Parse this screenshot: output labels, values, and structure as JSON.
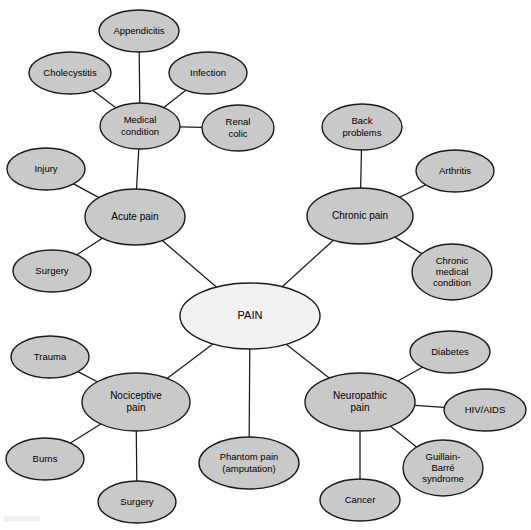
{
  "diagram": {
    "title": "PAIN",
    "type": "concept-map",
    "canvas": {
      "width": 531,
      "height": 530
    },
    "colors": {
      "root_fill": "#f1f1f1",
      "node_fill": "#c9c9c9",
      "stroke": "#1a1a1a",
      "text": "#000000",
      "background": "#ffffff"
    },
    "nodes": [
      {
        "id": "pain",
        "label": "PAIN",
        "lines": [
          "PAIN"
        ],
        "cx": 250,
        "cy": 316,
        "rx": 70,
        "ry": 33,
        "font": 11,
        "root": true
      },
      {
        "id": "acute-pain",
        "label": "Acute pain",
        "lines": [
          "Acute pain"
        ],
        "cx": 135,
        "cy": 217,
        "rx": 50,
        "ry": 28,
        "font": 10,
        "root": false
      },
      {
        "id": "chronic-pain",
        "label": "Chronic pain",
        "lines": [
          "Chronic pain"
        ],
        "cx": 360,
        "cy": 216,
        "rx": 53,
        "ry": 28,
        "font": 10,
        "root": false
      },
      {
        "id": "nociceptive-pain",
        "label": "Nociceptive pain",
        "lines": [
          "Nociceptive",
          "pain"
        ],
        "cx": 136,
        "cy": 402,
        "rx": 54,
        "ry": 29,
        "font": 10,
        "root": false
      },
      {
        "id": "neuropathic-pain",
        "label": "Neuropathic pain",
        "lines": [
          "Neuropathic",
          "pain"
        ],
        "cx": 360,
        "cy": 402,
        "rx": 55,
        "ry": 29,
        "font": 10,
        "root": false
      },
      {
        "id": "phantom-pain",
        "label": "Phantom pain (amputation)",
        "lines": [
          "Phantom pain",
          "(amputation)"
        ],
        "cx": 249,
        "cy": 463,
        "rx": 50,
        "ry": 26,
        "font": 9.5,
        "root": false
      },
      {
        "id": "medical-condition",
        "label": "Medical condition",
        "lines": [
          "Medical",
          "condition"
        ],
        "cx": 140,
        "cy": 126,
        "rx": 40,
        "ry": 23,
        "font": 9.5,
        "root": false
      },
      {
        "id": "appendicitis",
        "label": "Appendicitis",
        "lines": [
          "Appendicitis"
        ],
        "cx": 139,
        "cy": 31,
        "rx": 40,
        "ry": 21,
        "font": 9.5,
        "root": false
      },
      {
        "id": "cholecystitis",
        "label": "Cholecystitis",
        "lines": [
          "Cholecystitis"
        ],
        "cx": 70,
        "cy": 73,
        "rx": 41,
        "ry": 21,
        "font": 9.5,
        "root": false
      },
      {
        "id": "infection",
        "label": "Infection",
        "lines": [
          "Infection"
        ],
        "cx": 208,
        "cy": 73,
        "rx": 39,
        "ry": 21,
        "font": 9.5,
        "root": false
      },
      {
        "id": "renal-colic",
        "label": "Renal colic",
        "lines": [
          "Renal",
          "colic"
        ],
        "cx": 238,
        "cy": 128,
        "rx": 36,
        "ry": 23,
        "font": 9.5,
        "root": false
      },
      {
        "id": "injury",
        "label": "Injury",
        "lines": [
          "Injury"
        ],
        "cx": 46,
        "cy": 169,
        "rx": 39,
        "ry": 21,
        "font": 9.5,
        "root": false
      },
      {
        "id": "surgery-acute",
        "label": "Surgery",
        "lines": [
          "Surgery"
        ],
        "cx": 52,
        "cy": 271,
        "rx": 39,
        "ry": 21,
        "font": 9.5,
        "root": false
      },
      {
        "id": "back-problems",
        "label": "Back problems",
        "lines": [
          "Back",
          "problems"
        ],
        "cx": 362,
        "cy": 127,
        "rx": 40,
        "ry": 23,
        "font": 9.5,
        "root": false
      },
      {
        "id": "arthritis",
        "label": "Arthritis",
        "lines": [
          "Arthritis"
        ],
        "cx": 455,
        "cy": 171,
        "rx": 39,
        "ry": 21,
        "font": 9.5,
        "root": false
      },
      {
        "id": "chronic-medical-condition",
        "label": "Chronic medical condition",
        "lines": [
          "Chronic",
          "medical",
          "condition"
        ],
        "cx": 452,
        "cy": 272,
        "rx": 40,
        "ry": 28,
        "font": 9.5,
        "root": false
      },
      {
        "id": "trauma",
        "label": "Trauma",
        "lines": [
          "Trauma"
        ],
        "cx": 50,
        "cy": 357,
        "rx": 39,
        "ry": 21,
        "font": 9.5,
        "root": false
      },
      {
        "id": "burns",
        "label": "Burns",
        "lines": [
          "Burns"
        ],
        "cx": 45,
        "cy": 459,
        "rx": 39,
        "ry": 21,
        "font": 9.5,
        "root": false
      },
      {
        "id": "surgery-nociceptive",
        "label": "Surgery",
        "lines": [
          "Surgery"
        ],
        "cx": 137,
        "cy": 502,
        "rx": 39,
        "ry": 21,
        "font": 9.5,
        "root": false
      },
      {
        "id": "diabetes",
        "label": "Diabetes",
        "lines": [
          "Diabetes"
        ],
        "cx": 450,
        "cy": 352,
        "rx": 40,
        "ry": 21,
        "font": 9.5,
        "root": false
      },
      {
        "id": "hiv-aids",
        "label": "HIV/AIDS",
        "lines": [
          "HIV/AIDS"
        ],
        "cx": 485,
        "cy": 410,
        "rx": 41,
        "ry": 21,
        "font": 9.5,
        "root": false
      },
      {
        "id": "guillain-barre",
        "label": "Guillain-Barré syndrome",
        "lines": [
          "Guillain-",
          "Barré",
          "syndrome"
        ],
        "cx": 443,
        "cy": 468,
        "rx": 40,
        "ry": 28,
        "font": 9.5,
        "root": false
      },
      {
        "id": "cancer",
        "label": "Cancer",
        "lines": [
          "Cancer"
        ],
        "cx": 360,
        "cy": 500,
        "rx": 40,
        "ry": 21,
        "font": 9.5,
        "root": false
      }
    ],
    "edges": [
      {
        "from": "pain",
        "to": "acute-pain"
      },
      {
        "from": "pain",
        "to": "chronic-pain"
      },
      {
        "from": "pain",
        "to": "nociceptive-pain"
      },
      {
        "from": "pain",
        "to": "neuropathic-pain"
      },
      {
        "from": "pain",
        "to": "phantom-pain"
      },
      {
        "from": "acute-pain",
        "to": "medical-condition"
      },
      {
        "from": "acute-pain",
        "to": "injury"
      },
      {
        "from": "acute-pain",
        "to": "surgery-acute"
      },
      {
        "from": "medical-condition",
        "to": "appendicitis"
      },
      {
        "from": "medical-condition",
        "to": "cholecystitis"
      },
      {
        "from": "medical-condition",
        "to": "infection"
      },
      {
        "from": "medical-condition",
        "to": "renal-colic"
      },
      {
        "from": "chronic-pain",
        "to": "back-problems"
      },
      {
        "from": "chronic-pain",
        "to": "arthritis"
      },
      {
        "from": "chronic-pain",
        "to": "chronic-medical-condition"
      },
      {
        "from": "nociceptive-pain",
        "to": "trauma"
      },
      {
        "from": "nociceptive-pain",
        "to": "burns"
      },
      {
        "from": "nociceptive-pain",
        "to": "surgery-nociceptive"
      },
      {
        "from": "neuropathic-pain",
        "to": "diabetes"
      },
      {
        "from": "neuropathic-pain",
        "to": "hiv-aids"
      },
      {
        "from": "neuropathic-pain",
        "to": "guillain-barre"
      },
      {
        "from": "neuropathic-pain",
        "to": "cancer"
      }
    ]
  }
}
